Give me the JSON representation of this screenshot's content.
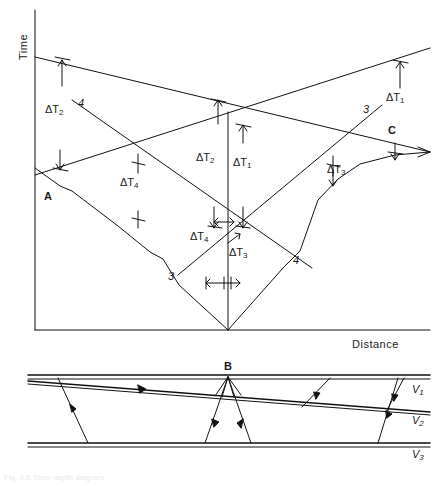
{
  "figure": {
    "type": "seismic-refraction-traveltime-diagram",
    "caption": "Fig. 4.6 Time-depth diagram"
  },
  "upper_plot": {
    "axes": {
      "y_title": "Time",
      "x_title": "Distance",
      "origin_x": 35,
      "origin_y": 330,
      "right_x": 430,
      "top_y": 10
    },
    "delta_labels": [
      {
        "name": "dT2-left",
        "text": "ΔT",
        "sub": "2",
        "x": 45,
        "y": 110
      },
      {
        "name": "dT2-center",
        "text": "ΔT",
        "sub": "2",
        "x": 196,
        "y": 158
      },
      {
        "name": "dT1-center",
        "text": "ΔT",
        "sub": "1",
        "x": 233,
        "y": 163
      },
      {
        "name": "dT1-right",
        "text": "ΔT",
        "sub": "1",
        "x": 386,
        "y": 98
      },
      {
        "name": "dT4-upper",
        "text": "ΔT",
        "sub": "4",
        "x": 120,
        "y": 183
      },
      {
        "name": "dT4-lower",
        "text": "ΔT",
        "sub": "4",
        "x": 190,
        "y": 237
      },
      {
        "name": "dT3-lower",
        "text": "ΔT",
        "sub": "3",
        "x": 229,
        "y": 253
      },
      {
        "name": "dT3-right",
        "text": "ΔT",
        "sub": "3",
        "x": 327,
        "y": 170
      }
    ],
    "ray_labels": [
      {
        "name": "ray-4-upper-left",
        "text": "4",
        "x": 78,
        "y": 104
      },
      {
        "name": "ray-3-upper-right",
        "text": "3",
        "x": 363,
        "y": 110
      },
      {
        "name": "ray-3-lower-left",
        "text": "3",
        "x": 168,
        "y": 277
      },
      {
        "name": "ray-4-lower-right",
        "text": "4",
        "x": 293,
        "y": 261
      }
    ],
    "point_labels": [
      {
        "name": "point-A",
        "text": "A",
        "x": 44,
        "y": 197
      },
      {
        "name": "point-C",
        "text": "C",
        "x": 388,
        "y": 131
      }
    ]
  },
  "lower_section": {
    "point_labels": [
      {
        "name": "point-B",
        "text": "B",
        "x": 224,
        "y": 368
      }
    ],
    "velocity_labels": [
      {
        "name": "velocity-v1",
        "text": "V",
        "sub": "1",
        "x": 412,
        "y": 390
      },
      {
        "name": "velocity-v2",
        "text": "V",
        "sub": "2",
        "x": 412,
        "y": 421
      },
      {
        "name": "velocity-v3",
        "text": "V",
        "sub": "3",
        "x": 412,
        "y": 455
      }
    ]
  }
}
